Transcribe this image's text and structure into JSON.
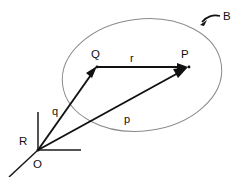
{
  "diagram": {
    "type": "vector-position-diagram",
    "background_color": "#ffffff",
    "line_color": "#111111",
    "region_color": "#8a8a8a",
    "points": [
      {
        "id": "origin",
        "label": "O",
        "x": 38,
        "y": 150,
        "label_x": 33,
        "label_y": 167
      },
      {
        "id": "reference",
        "label": "R",
        "x": 38,
        "y": 150,
        "label_x": 19,
        "label_y": 145
      },
      {
        "id": "source",
        "label": "Q",
        "x": 97,
        "y": 67,
        "label_x": 91,
        "label_y": 58
      },
      {
        "id": "field",
        "label": "P",
        "x": 187,
        "y": 67,
        "label_x": 181,
        "label_y": 58
      }
    ],
    "vectors": [
      {
        "id": "q-vector",
        "label": "q",
        "from": "O",
        "to": "Q",
        "label_x": 52,
        "label_y": 114
      },
      {
        "id": "p-vector",
        "label": "p",
        "from": "O",
        "to": "P",
        "label_x": 124,
        "label_y": 122
      },
      {
        "id": "r-vector",
        "label": "r",
        "from": "Q",
        "to": "P",
        "label_x": 130,
        "label_y": 61
      }
    ],
    "region": {
      "id": "body-region",
      "label": "B",
      "label_x": 223,
      "label_y": 20,
      "center_x": 142,
      "center_y": 75,
      "radius_x": 80,
      "radius_y": 56,
      "rotation_deg": -7
    },
    "axes": [
      {
        "id": "axis-vertical",
        "x1": 38,
        "y1": 150,
        "x2": 38,
        "y2": 112
      },
      {
        "id": "axis-horizontal",
        "x1": 38,
        "y1": 150,
        "x2": 80,
        "y2": 150
      },
      {
        "id": "axis-oblique",
        "x1": 38,
        "y1": 150,
        "x2": 10,
        "y2": 176
      }
    ]
  }
}
